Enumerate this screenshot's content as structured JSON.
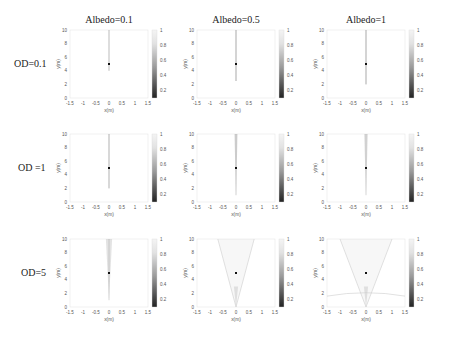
{
  "figure": {
    "col_titles": [
      "Albedo=0.1",
      "Albedo=0.5",
      "Albedo=1"
    ],
    "row_labels": [
      "OD=0.1",
      "OD =1",
      "OD=5"
    ],
    "xlabel": "x(m)",
    "ylabel": "y(m)",
    "xticks": [
      "-1.5",
      "-1",
      "-0.5",
      "0",
      "0.5",
      "1",
      "1.5"
    ],
    "yticks": [
      "0",
      "2",
      "4",
      "6",
      "8",
      "10"
    ],
    "cbar_ticks": [
      "0.2",
      "0.4",
      "0.6",
      "0.8",
      "1"
    ]
  },
  "chart_data": {
    "type": "heatmap",
    "title": "",
    "layout": "3x3 grid of grayscale intensity maps with colorbars",
    "columns": [
      "Albedo=0.1",
      "Albedo=0.5",
      "Albedo=1"
    ],
    "rows": [
      "OD=0.1",
      "OD =1",
      "OD=5"
    ],
    "xlabel": "x(m)",
    "ylabel": "y(m)",
    "xlim": [
      -1.5,
      1.5
    ],
    "ylim": [
      0,
      10
    ],
    "colorbar": {
      "range": [
        0.1,
        1
      ],
      "ticks": [
        0.2,
        0.4,
        0.6,
        0.8,
        1
      ],
      "colormap": "gray"
    },
    "source_point": {
      "x": 0,
      "y": 5
    },
    "panels": [
      {
        "row": "OD=0.1",
        "col": "Albedo=0.1",
        "description": "thin vertical streak near x=0 from y~4 to y~7, dark source point at (0,5)"
      },
      {
        "row": "OD=0.1",
        "col": "Albedo=0.5",
        "description": "thin vertical streak at x=0 from y~2.5 to y=10, source at (0,5)"
      },
      {
        "row": "OD=0.1",
        "col": "Albedo=1",
        "description": "thin vertical streak at x=0 from y~2 to y=10, source at (0,5)"
      },
      {
        "row": "OD =1",
        "col": "Albedo=0.1",
        "description": "vertical streak at x=0 from y~2 to y=10, source at (0,5)"
      },
      {
        "row": "OD =1",
        "col": "Albedo=0.5",
        "description": "narrow wedge at x=0 from y~1 to y=10, source at (0,5)"
      },
      {
        "row": "OD =1",
        "col": "Albedo=1",
        "description": "narrow wedge at x=0 from y~1 to y=10 with faint spread, source at (0,5)"
      },
      {
        "row": "OD=5",
        "col": "Albedo=0.1",
        "description": "wedge widening upward from y~1 to y=10, width ~0.2 at top, source at (0,5)"
      },
      {
        "row": "OD=5",
        "col": "Albedo=0.5",
        "description": "faint V-shaped diffuse glow from (0,0) widening to x=+/-0.7 at y=10, source at (0,5)"
      },
      {
        "row": "OD=5",
        "col": "Albedo=1",
        "description": "faint V-shaped diffuse glow widening to x=+/-1 at y=10 plus faint arc near y~2 across width, source at (0,5)"
      }
    ]
  }
}
